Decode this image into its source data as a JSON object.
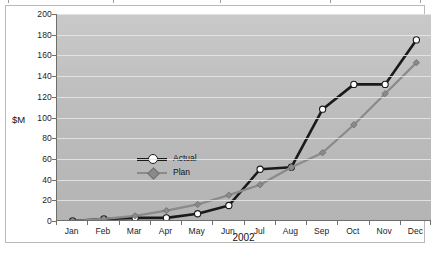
{
  "chart_data": {
    "type": "line",
    "title": "",
    "subtitle": "",
    "xlabel": "2002",
    "ylabel": "$M",
    "categories": [
      "Jan",
      "Feb",
      "Mar",
      "Apr",
      "May",
      "Jun",
      "Jul",
      "Aug",
      "Sep",
      "Oct",
      "Nov",
      "Dec"
    ],
    "ylim": [
      0,
      200
    ],
    "ytick_step": 20,
    "yticks": [
      "0",
      "20",
      "40",
      "60",
      "80",
      "100",
      "120",
      "140",
      "160",
      "180",
      "200"
    ],
    "grid": true,
    "legend_position": "inside-left",
    "series": [
      {
        "name": "Actual",
        "color": "#1a1a1a",
        "marker": "circle",
        "marker_fill": "#ffffff",
        "values": [
          0,
          2,
          3,
          3,
          7,
          15,
          50,
          52,
          108,
          132,
          132,
          175
        ]
      },
      {
        "name": "Plan",
        "color": "#8a8a8a",
        "marker": "diamond",
        "marker_fill": "#8a8a8a",
        "values": [
          0,
          2,
          5,
          10,
          16,
          25,
          35,
          52,
          66,
          93,
          123,
          153
        ]
      }
    ],
    "plot_background": "#c0c0c0",
    "gridline_color": "#e8e8e8",
    "axis_color": "#6e6e6e",
    "frame_border_color": "#b9b9b9",
    "page_background": "#ffffff"
  }
}
